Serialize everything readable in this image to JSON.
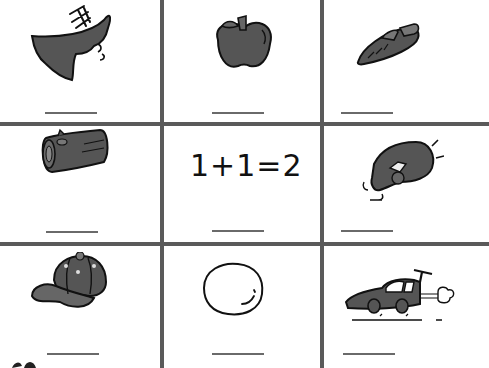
{
  "worksheet": {
    "grid": {
      "rows": 3,
      "cols": 3,
      "line_color": "#5a5a5a"
    },
    "cells": [
      {
        "row": 1,
        "col": 1,
        "item": "bird-wing-icon",
        "answer_blank": ""
      },
      {
        "row": 1,
        "col": 2,
        "item": "apple-icon",
        "answer_blank": ""
      },
      {
        "row": 1,
        "col": 3,
        "item": "carrot-icon",
        "answer_blank": ""
      },
      {
        "row": 2,
        "col": 1,
        "item": "log-icon",
        "answer_blank": ""
      },
      {
        "row": 2,
        "col": 2,
        "item": "equation",
        "text": "1+1=2",
        "answer_blank": ""
      },
      {
        "row": 2,
        "col": 3,
        "item": "finger-tap-icon",
        "answer_blank": ""
      },
      {
        "row": 3,
        "col": 1,
        "item": "cap-icon",
        "answer_blank": ""
      },
      {
        "row": 3,
        "col": 2,
        "item": "egg-icon",
        "answer_blank": ""
      },
      {
        "row": 3,
        "col": 3,
        "item": "race-car-icon",
        "answer_blank": ""
      }
    ],
    "fill_color": "#555555",
    "stroke_color": "#111111"
  }
}
